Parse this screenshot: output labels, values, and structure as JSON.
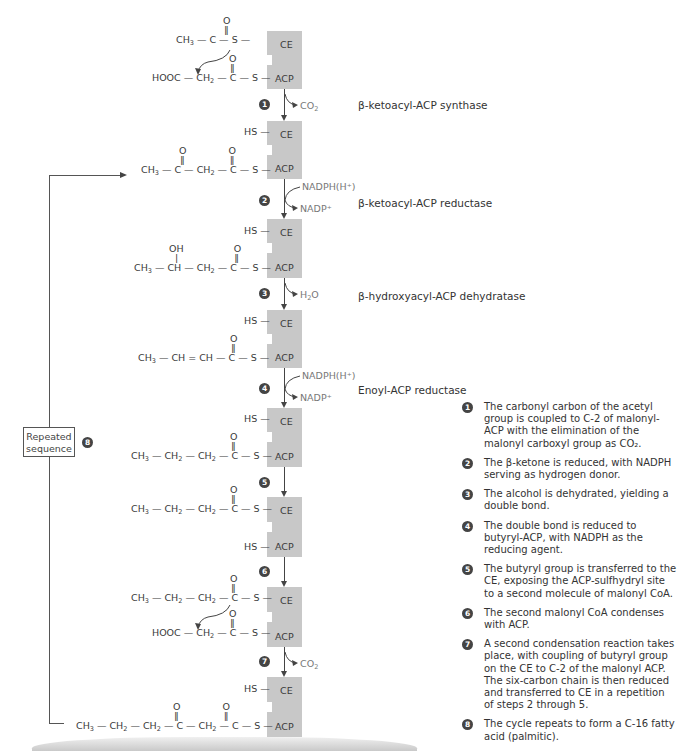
{
  "diagram": {
    "enzyme_labels": {
      "ce": "CE",
      "acp": "ACP"
    },
    "steps": [
      {
        "num": "1",
        "enzyme": "β-ketoacyl-ACP synthase",
        "side_out": "CO2"
      },
      {
        "num": "2",
        "enzyme": "β-ketoacyl-ACP reductase",
        "side_in": "NADPH(H⁺)",
        "side_out": "NADP⁺"
      },
      {
        "num": "3",
        "enzyme": "β-hydroxyacyl-ACP dehydratase",
        "side_out": "H2O"
      },
      {
        "num": "4",
        "enzyme": "Enoyl-ACP reductase",
        "side_in": "NADPH(H⁺)",
        "side_out": "NADP⁺"
      },
      {
        "num": "5"
      },
      {
        "num": "6"
      },
      {
        "num": "7",
        "side_out": "CO2"
      }
    ],
    "structures": {
      "s0_ce": "CH3—C(=O)—S—",
      "s0_acp": "HOOC—CH2—C(=O)—S—",
      "s1_ce": "HS—",
      "s1_acp": "CH3—C(=O)—CH2—C(=O)—S—",
      "s2_ce": "HS—",
      "s2_acp": "CH3—CH(OH)—CH2—C(=O)—S—",
      "s3_ce": "HS—",
      "s3_acp": "CH3—CH=CH—C(=O)—S—",
      "s4_ce": "HS—",
      "s4_acp": "CH3—CH2—CH2—C(=O)—S—",
      "s5_ce": "CH3—CH2—CH2—C(=O)—S—",
      "s5_acp": "HS—",
      "s6_ce": "CH3—CH2—CH2—C(=O)—S—",
      "s6_acp": "HOOC—CH2—C(=O)—S—",
      "s7_ce": "HS—",
      "s7_acp": "CH3—CH2—CH2—C(=O)—CH2—C(=O)—S—"
    },
    "repeat_box": {
      "line1": "Repeated",
      "line2": "sequence",
      "num": "8"
    }
  },
  "legend": [
    {
      "num": "1",
      "text": "The carbonyl carbon of the acetyl group is coupled to C-2 of malonyl-ACP with the elimination of the malonyl carboxyl group as CO₂."
    },
    {
      "num": "2",
      "text": "The β-ketone is reduced, with NADPH serving as hydrogen donor."
    },
    {
      "num": "3",
      "text": "The alcohol is dehydrated, yielding a double bond."
    },
    {
      "num": "4",
      "text": "The double bond is reduced to butyryl-ACP,  with NADPH as the reducing agent."
    },
    {
      "num": "5",
      "text": "The butyryl group is transferred to the CE, exposing the ACP-sulfhydryl site to a second molecule of malonyl CoA."
    },
    {
      "num": "6",
      "text": "The second malonyl CoA condenses with ACP."
    },
    {
      "num": "7",
      "text": "A second condensation reaction takes place, with coupling of butyryl group on the CE to C-2 of the malonyl ACP. The six-carbon chain is then reduced and transferred to CE in a repetition of steps 2 through 5."
    },
    {
      "num": "8",
      "text": "The cycle repeats to form a C-16 fatty acid (palmitic)."
    }
  ]
}
